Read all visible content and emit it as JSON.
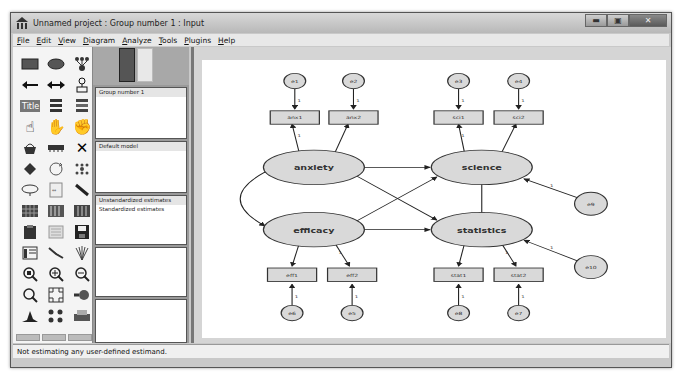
{
  "window": {
    "title": "Unnamed project : Group number 1 : Input",
    "controls": [
      "minimize",
      "maximize",
      "close"
    ]
  },
  "menu": [
    "File",
    "Edit",
    "View",
    "Diagram",
    "Analyze",
    "Tools",
    "Plugins",
    "Help"
  ],
  "toolbox": {
    "tools": [
      "draw-observed-variable-icon",
      "draw-unobserved-variable-icon",
      "draw-latent-indicator-icon",
      "draw-path-icon",
      "draw-covariance-icon",
      "add-unique-variable-icon",
      "figure-caption-icon",
      "list-variables-in-model-icon",
      "list-variables-in-dataset-icon",
      "select-one-object-icon",
      "select-all-objects-icon",
      "deselect-all-icon",
      "duplicate-icon",
      "move-icon",
      "erase-icon",
      "change-shape-icon",
      "rotate-indicators-icon",
      "reflect-indicators-icon",
      "move-parameter-icon",
      "scroll-icon",
      "touch-up-icon",
      "select-data-files-icon",
      "analysis-properties-icon",
      "calculate-estimates-icon",
      "copy-to-clipboard-icon",
      "view-text-icon",
      "save-diagram-icon",
      "object-properties-icon",
      "drag-properties-icon",
      "preserve-symmetries-icon",
      "zoom-area-icon",
      "zoom-in-icon",
      "zoom-out-icon",
      "zoom-page-icon",
      "fit-to-page-icon",
      "loupe-icon",
      "bayesian-icon",
      "multiple-group-icon",
      "print-icon"
    ]
  },
  "panels": {
    "groups": {
      "items": [
        "Group number 1"
      ]
    },
    "models": {
      "items": [
        "Default model"
      ]
    },
    "estimates": {
      "items": [
        "Unstandardized estimates",
        "Standardized estimates"
      ]
    }
  },
  "diagram": {
    "latent": [
      {
        "id": "anxiety",
        "label": "anxiety",
        "cx": 82,
        "cy": 112
      },
      {
        "id": "science",
        "label": "science",
        "cx": 205,
        "cy": 112
      },
      {
        "id": "efficacy",
        "label": "efficacy",
        "cx": 82,
        "cy": 177
      },
      {
        "id": "statistics",
        "label": "statistics",
        "cx": 205,
        "cy": 177
      }
    ],
    "observed": [
      {
        "label": "anx1",
        "x": 50,
        "y": 53
      },
      {
        "label": "anx2",
        "x": 93,
        "y": 53
      },
      {
        "label": "sci1",
        "x": 170,
        "y": 53
      },
      {
        "label": "sci2",
        "x": 214,
        "y": 53
      },
      {
        "label": "eff1",
        "x": 48,
        "y": 217
      },
      {
        "label": "eff2",
        "x": 92,
        "y": 217
      },
      {
        "label": "stat1",
        "x": 170,
        "y": 217
      },
      {
        "label": "stat2",
        "x": 214,
        "y": 217
      }
    ],
    "errors": [
      {
        "label": "e1",
        "cx": 68,
        "cy": 22
      },
      {
        "label": "e2",
        "cx": 111,
        "cy": 22
      },
      {
        "label": "e3",
        "cx": 188,
        "cy": 22
      },
      {
        "label": "e4",
        "cx": 232,
        "cy": 22
      },
      {
        "label": "e6",
        "cx": 66,
        "cy": 264
      },
      {
        "label": "e5",
        "cx": 110,
        "cy": 264
      },
      {
        "label": "e8",
        "cx": 188,
        "cy": 264
      },
      {
        "label": "e7",
        "cx": 232,
        "cy": 264
      },
      {
        "label": "e9",
        "cx": 287,
        "cy": 150
      },
      {
        "label": "e10",
        "cx": 287,
        "cy": 216
      }
    ],
    "path_label": "1"
  },
  "status": "Not estimating any user-defined estimand."
}
